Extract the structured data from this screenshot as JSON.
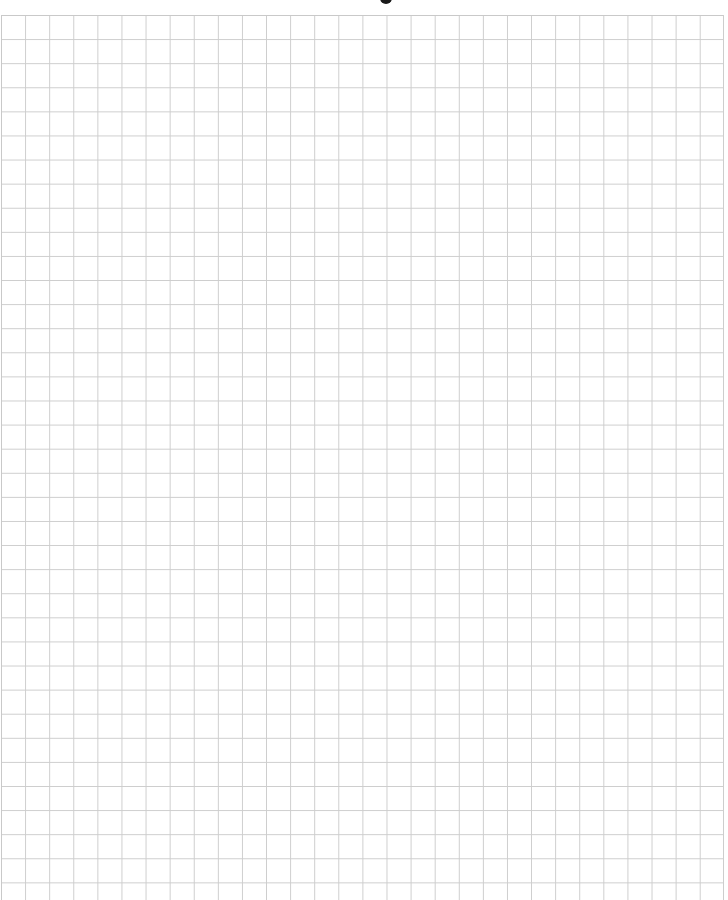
{
  "document": {
    "type": "graph-paper",
    "background_color": "#ffffff",
    "grid": {
      "line_color": "#cdcdcd",
      "cell_size_px": 24.1,
      "columns": 30,
      "rows": 37,
      "origin": {
        "x": 1,
        "y": 15
      }
    },
    "top_mark": {
      "shape": "partial-dark-glyph",
      "color": "#1a1a1a"
    },
    "title": ""
  }
}
